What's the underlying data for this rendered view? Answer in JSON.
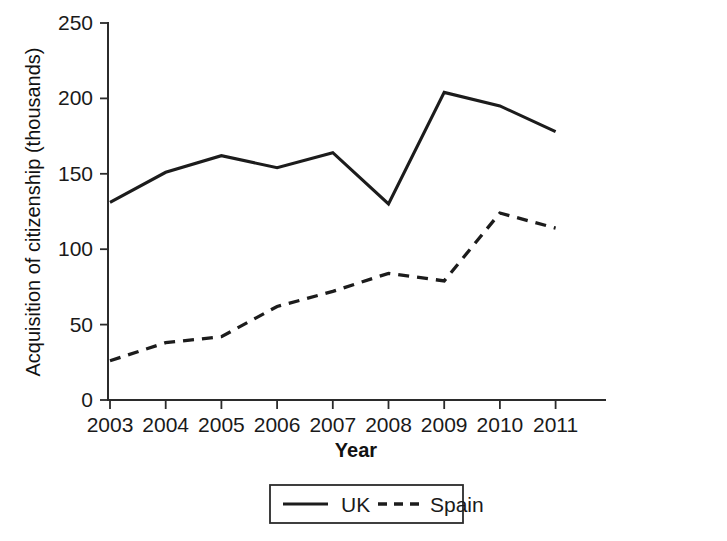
{
  "chart_data": {
    "type": "line",
    "title": "",
    "subtitle": "",
    "xlabel": "Year",
    "ylabel": "Acquisition of citizenship (thousands)",
    "x": [
      "2003",
      "2004",
      "2005",
      "2006",
      "2007",
      "2008",
      "2009",
      "2010",
      "2011"
    ],
    "categories": [
      "2003",
      "2004",
      "2005",
      "2006",
      "2007",
      "2008",
      "2009",
      "2010",
      "2011"
    ],
    "xlim": [
      2003,
      2011
    ],
    "ylim": [
      0,
      250
    ],
    "yticks": [
      0,
      50,
      100,
      150,
      200,
      250
    ],
    "ytick_labels": [
      "0",
      "50",
      "100",
      "150",
      "200",
      "250"
    ],
    "xtick_labels": [
      "2003",
      "2004",
      "2005",
      "2006",
      "2007",
      "2008",
      "2009",
      "2010",
      "2011"
    ],
    "grid": false,
    "legend_position": "bottom-center",
    "series": [
      {
        "name": "UK",
        "style": "solid",
        "color": "#1c1c1c",
        "values": [
          131,
          151,
          162,
          154,
          164,
          130,
          204,
          195,
          178
        ]
      },
      {
        "name": "Spain",
        "style": "dashed",
        "color": "#1c1c1c",
        "values": [
          26,
          38,
          42,
          62,
          72,
          84,
          79,
          124,
          114
        ]
      }
    ],
    "annotations": []
  },
  "legend": {
    "entries": [
      {
        "label": "UK",
        "style": "solid"
      },
      {
        "label": "Spain",
        "style": "dashed"
      }
    ]
  },
  "colors": {
    "line": "#1c1c1c",
    "axis": "#2b2b2b",
    "text": "#1a1a1a",
    "background": "#ffffff"
  }
}
